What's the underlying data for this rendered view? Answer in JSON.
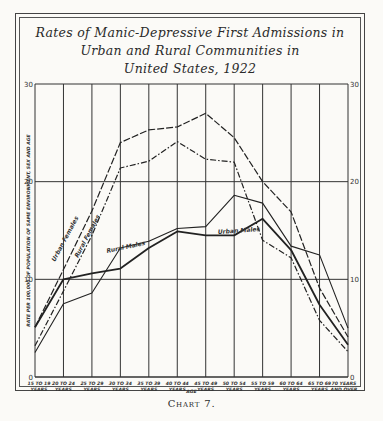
{
  "title_lines": [
    "Rates of Manic-Depressive First Admissions in",
    "Urban and Rural Communities in",
    "United States, 1922"
  ],
  "caption": "Chart 7.",
  "chart_data": {
    "type": "line",
    "title": "Rates of Manic-Depressive First Admissions in Urban and Rural Communities in United States, 1922",
    "xlabel": "Age",
    "ylabel": "Rate per 100,000 of population of same environment, sex and age",
    "ylim": [
      0,
      30
    ],
    "yticks": [
      0,
      10,
      20,
      30
    ],
    "grid": true,
    "legend_position": "inline labels on lines",
    "categories": [
      "15 to 19 years",
      "20 to 24 years",
      "25 to 29 years",
      "30 to 34 years",
      "35 to 39 years",
      "40 to 44 years",
      "45 to 49 years",
      "50 to 54 years",
      "55 to 59 years",
      "60 to 64 years",
      "65 to 69 years",
      "70 years and over"
    ],
    "category_short": [
      "15 TO 19",
      "20 TO 24",
      "25 TO 29",
      "30 TO 34",
      "35 TO 39",
      "40 TO 44",
      "45 TO 49",
      "50 TO 54",
      "55 TO 59",
      "60 TO 64",
      "65 TO 69",
      "70 YEARS"
    ],
    "category_sub": [
      "YEARS",
      "YEARS",
      "YEARS",
      "YEARS",
      "YEARS",
      "YEARS",
      "YEARS",
      "YEARS",
      "YEARS",
      "YEARS",
      "YEARS",
      "AND OVER"
    ],
    "series": [
      {
        "name": "Urban Females",
        "style": "long-dash",
        "values": [
          5.1,
          11.0,
          17.0,
          24.0,
          25.3,
          25.6,
          27.0,
          24.5,
          20.0,
          16.9,
          9.1,
          4.1
        ]
      },
      {
        "name": "Rural Females",
        "style": "dash-dot",
        "values": [
          3.2,
          8.8,
          14.5,
          21.4,
          22.1,
          24.1,
          22.3,
          22.0,
          14.0,
          12.2,
          5.8,
          2.6
        ]
      },
      {
        "name": "Rural Males",
        "style": "thin-solid",
        "values": [
          2.5,
          7.5,
          8.6,
          13.2,
          13.9,
          15.2,
          15.4,
          18.6,
          17.8,
          13.4,
          12.5,
          5.0
        ]
      },
      {
        "name": "Urban Males",
        "style": "thick-solid",
        "values": [
          5.1,
          10.0,
          10.6,
          11.1,
          13.2,
          14.9,
          14.5,
          14.5,
          16.2,
          13.0,
          7.4,
          3.3
        ]
      }
    ]
  },
  "axis": {
    "ylabel_text": "RATE PER 100,000 OF POPULATION OF SAME ENVIRONMENT, SEX AND AGE",
    "xlabel_text": "AGE"
  }
}
